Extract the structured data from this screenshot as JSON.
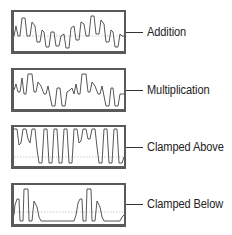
{
  "diagram": {
    "title": "",
    "panels": [
      {
        "id": "addition",
        "label": "Addition",
        "top": 10,
        "line_y": 32
      },
      {
        "id": "multiplication",
        "label": "Multiplication",
        "top": 68,
        "line_y": 90
      },
      {
        "id": "clamped-above",
        "label": "Clamped Above",
        "top": 125,
        "line_y": 147
      },
      {
        "id": "clamped-below",
        "label": "Clamped Below",
        "top": 183,
        "line_y": 204
      }
    ],
    "colors": {
      "frame": "#5a5a5a",
      "wave": "#444444",
      "midline": "#bbbbbb",
      "text": "#222222"
    }
  }
}
